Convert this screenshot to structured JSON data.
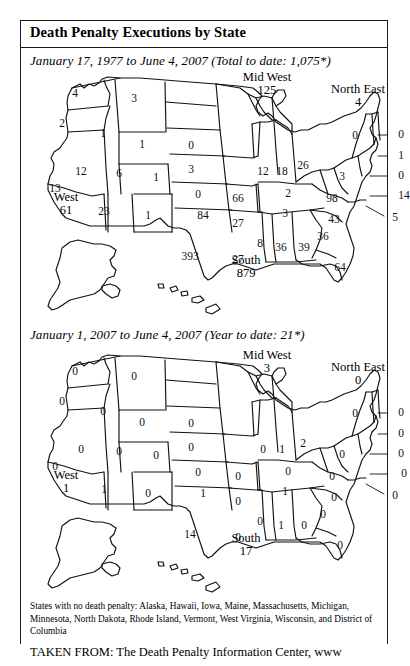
{
  "document": {
    "title": "Death Penalty Executions by State",
    "subtitle_map1": "January 17, 1977 to June 4, 2007 (Total to date: 1,075*)",
    "subtitle_map2": "January 1, 2007 to June 4, 2007 (Year to date: 21*)",
    "footnote": "States with no death penalty: Alaska, Hawaii, Iowa, Maine, Massachusetts, Michigan, Minnesota, North Dakota, Rhode Island, Vermont, West Virginia, Wisconsin, and District of Columbia",
    "source": "TAKEN FROM: The Death Penalty Information Center, www"
  },
  "chart_data": {
    "type": "map",
    "title": "Death Penalty Executions by State",
    "maps": [
      {
        "name": "total-to-date",
        "caption": "January 17, 1977 to June 4, 2007 (Total to date: 1,075*)",
        "total": "1,075*",
        "regions": [
          {
            "name": "West",
            "value": "61",
            "x": 46,
            "y": 132
          },
          {
            "name": "Mid West",
            "value": "125",
            "x": 247,
            "y": 12
          },
          {
            "name": "North East",
            "value": "4",
            "x": 338,
            "y": 24
          },
          {
            "name": "South",
            "value": "879",
            "x": 226,
            "y": 195
          }
        ],
        "states": [
          {
            "state": "WA",
            "value": "4",
            "x": 55,
            "y": 22
          },
          {
            "state": "OR",
            "value": "2",
            "x": 42,
            "y": 52
          },
          {
            "state": "ID",
            "value": "1",
            "x": 83,
            "y": 62
          },
          {
            "state": "MT",
            "value": "3",
            "x": 114,
            "y": 27
          },
          {
            "state": "WY",
            "value": "1",
            "x": 122,
            "y": 73
          },
          {
            "state": "NV",
            "value": "12",
            "x": 61,
            "y": 100
          },
          {
            "state": "CA",
            "value": "13",
            "x": 35,
            "y": 117
          },
          {
            "state": "UT",
            "value": "6",
            "x": 99,
            "y": 102
          },
          {
            "state": "CO",
            "value": "1",
            "x": 136,
            "y": 106
          },
          {
            "state": "AZ",
            "value": "23",
            "x": 84,
            "y": 140
          },
          {
            "state": "NM",
            "value": "1",
            "x": 128,
            "y": 144
          },
          {
            "state": "SD",
            "value": "0",
            "x": 171,
            "y": 74
          },
          {
            "state": "NE",
            "value": "3",
            "x": 171,
            "y": 98
          },
          {
            "state": "KS",
            "value": "0",
            "x": 178,
            "y": 123
          },
          {
            "state": "OK",
            "value": "84",
            "x": 183,
            "y": 144
          },
          {
            "state": "TX",
            "value": "393",
            "x": 170,
            "y": 185
          },
          {
            "state": "MO",
            "value": "66",
            "x": 218,
            "y": 127
          },
          {
            "state": "AR",
            "value": "27",
            "x": 218,
            "y": 152
          },
          {
            "state": "LA",
            "value": "27",
            "x": 218,
            "y": 188
          },
          {
            "state": "MS",
            "value": "8",
            "x": 240,
            "y": 172
          },
          {
            "state": "AL",
            "value": "36",
            "x": 261,
            "y": 176
          },
          {
            "state": "GA",
            "value": "39",
            "x": 284,
            "y": 176
          },
          {
            "state": "FL",
            "value": "64",
            "x": 320,
            "y": 196
          },
          {
            "state": "IL",
            "value": "12",
            "x": 243,
            "y": 100
          },
          {
            "state": "IN",
            "value": "18",
            "x": 262,
            "y": 100
          },
          {
            "state": "OH",
            "value": "26",
            "x": 283,
            "y": 94
          },
          {
            "state": "KY",
            "value": "2",
            "x": 268,
            "y": 122
          },
          {
            "state": "TN",
            "value": "3",
            "x": 265,
            "y": 142
          },
          {
            "state": "VA",
            "value": "98",
            "x": 312,
            "y": 127
          },
          {
            "state": "NC",
            "value": "43",
            "x": 314,
            "y": 148
          },
          {
            "state": "SC",
            "value": "36",
            "x": 303,
            "y": 165
          },
          {
            "state": "PA",
            "value": "3",
            "x": 322,
            "y": 105
          },
          {
            "state": "NY",
            "value": "0",
            "x": 335,
            "y": 64
          }
        ],
        "callouts": [
          {
            "label": "0",
            "x": 381,
            "y": 63
          },
          {
            "label": "1",
            "x": 381,
            "y": 84
          },
          {
            "label": "0",
            "x": 381,
            "y": 104
          },
          {
            "label": "14",
            "x": 384,
            "y": 124
          },
          {
            "label": "5",
            "x": 375,
            "y": 146
          }
        ]
      },
      {
        "name": "year-to-date",
        "caption": "January 1, 2007 to June 4, 2007 (Year to date: 21*)",
        "total": "21*",
        "regions": [
          {
            "name": "West",
            "value": "1",
            "x": 46,
            "y": 132
          },
          {
            "name": "Mid West",
            "value": "3",
            "x": 247,
            "y": 12
          },
          {
            "name": "North East",
            "value": "0",
            "x": 338,
            "y": 24
          },
          {
            "name": "South",
            "value": "17",
            "x": 226,
            "y": 195
          }
        ],
        "states": [
          {
            "state": "WA",
            "value": "0",
            "x": 55,
            "y": 22
          },
          {
            "state": "OR",
            "value": "0",
            "x": 42,
            "y": 52
          },
          {
            "state": "ID",
            "value": "0",
            "x": 83,
            "y": 62
          },
          {
            "state": "MT",
            "value": "0",
            "x": 114,
            "y": 27
          },
          {
            "state": "WY",
            "value": "0",
            "x": 122,
            "y": 73
          },
          {
            "state": "NV",
            "value": "0",
            "x": 61,
            "y": 100
          },
          {
            "state": "CA",
            "value": "0",
            "x": 35,
            "y": 117
          },
          {
            "state": "UT",
            "value": "0",
            "x": 99,
            "y": 102
          },
          {
            "state": "CO",
            "value": "0",
            "x": 136,
            "y": 106
          },
          {
            "state": "AZ",
            "value": "1",
            "x": 84,
            "y": 140
          },
          {
            "state": "NM",
            "value": "0",
            "x": 128,
            "y": 144
          },
          {
            "state": "SD",
            "value": "0",
            "x": 171,
            "y": 74
          },
          {
            "state": "NE",
            "value": "0",
            "x": 171,
            "y": 98
          },
          {
            "state": "KS",
            "value": "0",
            "x": 178,
            "y": 123
          },
          {
            "state": "OK",
            "value": "1",
            "x": 183,
            "y": 144
          },
          {
            "state": "TX",
            "value": "14",
            "x": 170,
            "y": 185
          },
          {
            "state": "MO",
            "value": "0",
            "x": 218,
            "y": 127
          },
          {
            "state": "AR",
            "value": "0",
            "x": 218,
            "y": 152
          },
          {
            "state": "LA",
            "value": "0",
            "x": 218,
            "y": 188
          },
          {
            "state": "MS",
            "value": "0",
            "x": 240,
            "y": 172
          },
          {
            "state": "AL",
            "value": "1",
            "x": 261,
            "y": 176
          },
          {
            "state": "GA",
            "value": "0",
            "x": 284,
            "y": 176
          },
          {
            "state": "FL",
            "value": "0",
            "x": 320,
            "y": 196
          },
          {
            "state": "IL",
            "value": "0",
            "x": 243,
            "y": 100
          },
          {
            "state": "IN",
            "value": "1",
            "x": 262,
            "y": 100
          },
          {
            "state": "OH",
            "value": "2",
            "x": 283,
            "y": 94
          },
          {
            "state": "KY",
            "value": "0",
            "x": 268,
            "y": 122
          },
          {
            "state": "TN",
            "value": "1",
            "x": 265,
            "y": 142
          },
          {
            "state": "VA",
            "value": "0",
            "x": 312,
            "y": 127
          },
          {
            "state": "NC",
            "value": "0",
            "x": 314,
            "y": 148
          },
          {
            "state": "SC",
            "value": "0",
            "x": 303,
            "y": 165
          },
          {
            "state": "PA",
            "value": "0",
            "x": 322,
            "y": 105
          },
          {
            "state": "NY",
            "value": "0",
            "x": 335,
            "y": 64
          }
        ],
        "callouts": [
          {
            "label": "0",
            "x": 381,
            "y": 63
          },
          {
            "label": "0",
            "x": 381,
            "y": 84
          },
          {
            "label": "0",
            "x": 381,
            "y": 104
          },
          {
            "label": "0",
            "x": 384,
            "y": 124
          },
          {
            "label": "0",
            "x": 375,
            "y": 146
          }
        ]
      }
    ]
  }
}
